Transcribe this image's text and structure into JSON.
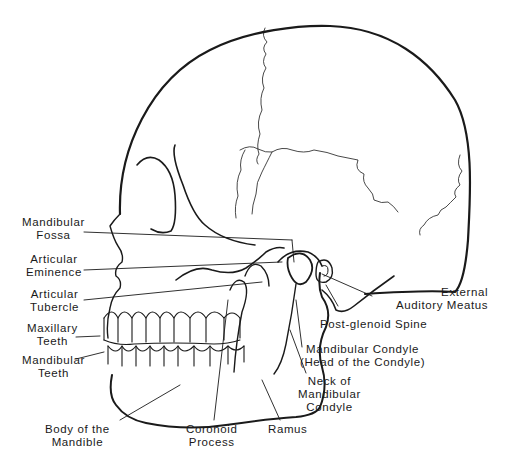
{
  "figure": {
    "line_color": "#1a1a1a",
    "background": "#ffffff"
  },
  "labels": {
    "mandibular_fossa": [
      "Mandibular",
      "Fossa"
    ],
    "articular_eminence": [
      "Articular",
      "Eminence"
    ],
    "articular_tubercle": [
      "Articular",
      "Tubercle"
    ],
    "maxillary_teeth": [
      "Maxillary",
      "Teeth"
    ],
    "mandibular_teeth": [
      "Mandibular",
      "Teeth"
    ],
    "external_auditory_meatus": [
      "External",
      "Auditory Meatus"
    ],
    "post_glenoid_spine": [
      "Post-glenoid Spine"
    ],
    "mandibular_condyle": [
      "Mandibular Condyle",
      "(Head of the Condyle)"
    ],
    "neck_of_mandibular_condyle": [
      "Neck of",
      "Mandibular",
      "Condyle"
    ],
    "body_of_mandible": [
      "Body of the",
      "Mandible"
    ],
    "coronoid_process": [
      "Coronoid",
      "Process"
    ],
    "ramus": [
      "Ramus"
    ]
  }
}
